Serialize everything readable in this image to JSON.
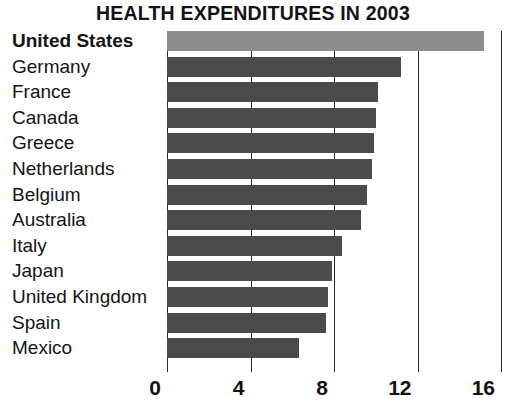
{
  "chart_data": {
    "type": "bar",
    "orientation": "horizontal",
    "title": "HEALTH EXPENDITURES IN 2003",
    "xlabel": "",
    "ylabel": "",
    "xlim": [
      0,
      16
    ],
    "xticks": [
      0,
      4,
      8,
      12,
      16
    ],
    "xtick_labels": [
      "0",
      "4",
      "8",
      "12",
      "16"
    ],
    "grid": true,
    "grid_axis": "x",
    "legend": false,
    "categories": [
      "United States",
      "Germany",
      "France",
      "Canada",
      "Greece",
      "Netherlands",
      "Belgium",
      "Australia",
      "Italy",
      "Japan",
      "United Kingdom",
      "Spain",
      "Mexico"
    ],
    "values": [
      15.2,
      11.2,
      10.1,
      10.0,
      9.9,
      9.8,
      9.6,
      9.3,
      8.4,
      7.9,
      7.7,
      7.6,
      6.3
    ],
    "highlight_index": 0,
    "colors": {
      "bar": "#4b4b4b",
      "bar_highlight": "#8e8e8e",
      "axis": "#2b2b2b",
      "text": "#141414",
      "background": "#ffffff"
    }
  }
}
